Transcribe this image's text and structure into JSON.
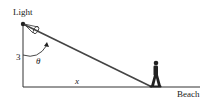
{
  "diagram": {
    "labels": {
      "light": "Light",
      "height": "3",
      "angle": "θ",
      "distance": "x",
      "ground": "Beach"
    },
    "colors": {
      "stroke": "#333333",
      "background": "#ffffff"
    }
  }
}
